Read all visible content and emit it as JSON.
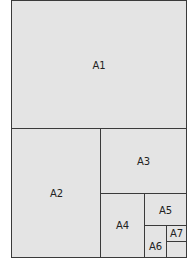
{
  "cells": [
    {
      "label": "A1"
    },
    {
      "label": "A2"
    },
    {
      "label": "A3"
    },
    {
      "label": "A4"
    },
    {
      "label": "A5"
    },
    {
      "label": "A6"
    },
    {
      "label": "A7"
    }
  ]
}
